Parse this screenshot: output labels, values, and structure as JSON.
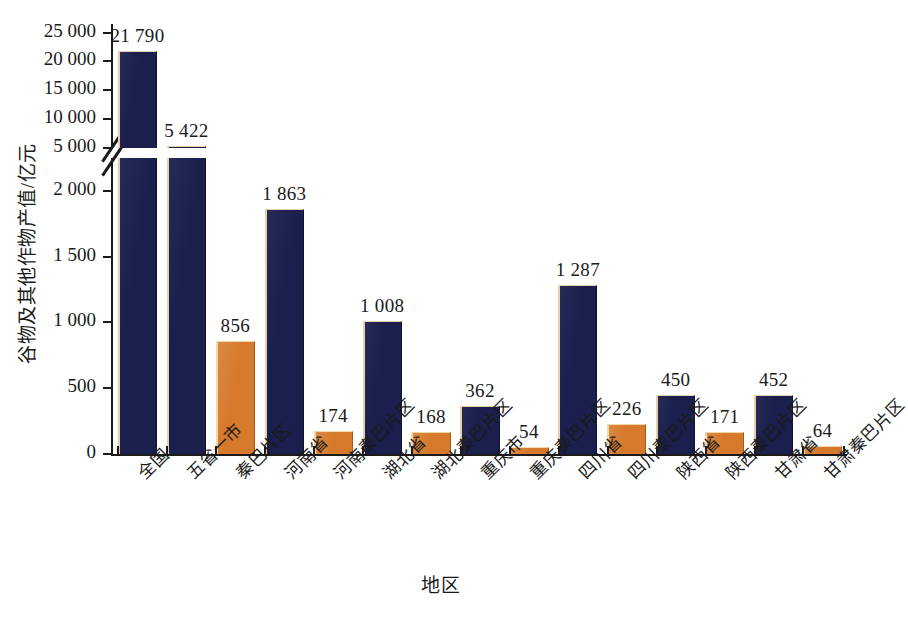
{
  "chart_data": {
    "type": "bar",
    "title": "",
    "xlabel": "地区",
    "ylabel": "谷物及其他作物产值/亿元",
    "categories": [
      "全国",
      "五省一市",
      "秦巴片区",
      "河南省",
      "河南秦巴片区",
      "湖北省",
      "湖北秦巴片区",
      "重庆市",
      "重庆秦巴片区",
      "四川省",
      "四川秦巴片区",
      "陕西省",
      "陕西秦巴片区",
      "甘肃省",
      "甘肃秦巴片区"
    ],
    "values": [
      21790,
      5422,
      856,
      1863,
      174,
      1008,
      168,
      362,
      54,
      1287,
      226,
      450,
      171,
      452,
      64
    ],
    "value_labels": [
      "21 790",
      "5 422",
      "856",
      "1 863",
      "174",
      "1 008",
      "168",
      "362",
      "54",
      "1 287",
      "226",
      "450",
      "171",
      "452",
      "64"
    ],
    "bar_colors": [
      "blue",
      "blue",
      "orange",
      "blue",
      "orange",
      "blue",
      "orange",
      "blue",
      "orange",
      "blue",
      "orange",
      "blue",
      "orange",
      "blue",
      "orange"
    ],
    "colors": {
      "blue": "#1a1f4d",
      "orange": "#d6792b",
      "bar_highlight": "#e8cfa8",
      "axis": "#1a1a1a",
      "background": "#ffffff"
    },
    "broken_axis": true,
    "axis_break_at": 5000,
    "lower_panel": {
      "ylim": [
        0,
        2250
      ],
      "ticks": [
        0,
        500,
        1000,
        1500,
        2000
      ],
      "tick_labels": [
        "0",
        "500",
        "1 000",
        "1 500",
        "2 000"
      ]
    },
    "upper_panel": {
      "ylim": [
        5000,
        26500
      ],
      "ticks": [
        5000,
        10000,
        15000,
        20000,
        25000
      ],
      "tick_labels": [
        "5 000",
        "10 000",
        "15 000",
        "20 000",
        "25 000"
      ]
    },
    "grid": false,
    "legend": null
  }
}
